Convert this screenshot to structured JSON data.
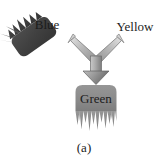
{
  "figure": {
    "caption": "(a)",
    "background_color": "#ffffff",
    "width": 168,
    "height": 162
  },
  "nodes": {
    "blue": {
      "label": "Blue",
      "shape": "frayed-blob",
      "fill_color": "#474747",
      "text_color": "#1b1b1b",
      "rotation_deg": -35,
      "role": "input-left"
    },
    "yellow": {
      "label": "Yellow",
      "shape": "text-only",
      "fill_color": "#ffffff",
      "text_color": "#1d1d1d",
      "role": "input-right"
    },
    "green": {
      "label": "Green",
      "shape": "frayed-blob",
      "fill_color": "#8b8b8b",
      "text_color": "#1c1c1c",
      "rotation_deg": 0,
      "role": "output"
    }
  },
  "arrow": {
    "name": "merge-arrow",
    "shape": "y-merge-arrow",
    "direction": "down",
    "fill_light": "#d0d0d0",
    "fill_mid": "#a8a8a8",
    "fill_dark": "#6f6f6f",
    "stroke_color": "#5a5a5a",
    "inputs": [
      "blue",
      "yellow"
    ],
    "output": "green"
  }
}
